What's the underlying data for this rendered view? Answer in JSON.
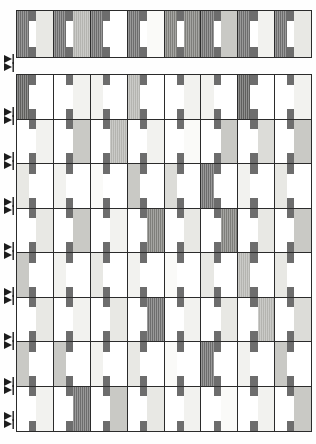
{
  "document": {
    "title": "Weave draft pattern",
    "background_color": "#fefefe",
    "line_color": "#2b2b2b"
  },
  "palette": {
    "white": "#ffffff",
    "paper": "#fafaf8",
    "very_light": "#f2f2ef",
    "light": "#e8e8e4",
    "light_gray": "#dcdcd8",
    "mid_light": "#c9c9c5",
    "mid": "#b4b4b0",
    "mid_dark": "#9a9a96",
    "dark": "#7e7e7a",
    "darker": "#6d6d6d",
    "darkest": "#5f5f5d",
    "knot": "#6d6d6d"
  },
  "layout": {
    "top_strip": {
      "x": 16,
      "y": 10,
      "width": 296,
      "height": 48,
      "columns": 8,
      "rows": 1
    },
    "main_grid": {
      "x": 16,
      "y": 74,
      "width": 296,
      "height": 358,
      "columns": 8,
      "rows": 8
    },
    "cell": {
      "left_pct": 34,
      "stripe_pct": 20,
      "right_pct": 46,
      "knot_height_pct": 22
    }
  },
  "markers": {
    "icon": "double-arrow-marker",
    "x": 3,
    "positions": [
      59,
      67,
      112,
      120,
      157,
      165,
      202,
      210,
      247,
      255,
      292,
      300,
      337,
      345,
      382,
      390,
      416,
      424
    ]
  },
  "chart_data": {
    "type": "heatmap",
    "xlabel": "",
    "ylabel": "",
    "legend": [],
    "grid": true,
    "categories": [
      "c1",
      "c2",
      "c3",
      "c4",
      "c5",
      "c6",
      "c7",
      "c8"
    ],
    "row_labels": [
      "t1",
      "r1",
      "r2",
      "r3",
      "r4",
      "r5",
      "r6",
      "r7",
      "r8"
    ],
    "note": "Each grid cell encodes two gray shades: a left block and a right block, separated by a white warp stripe carrying a dark knot square at top and bottom.",
    "top_strip": {
      "cells": [
        {
          "left": "darker",
          "right": "light"
        },
        {
          "left": "darker",
          "right": "mid"
        },
        {
          "left": "darker",
          "right": "white"
        },
        {
          "left": "darker",
          "right": "paper"
        },
        {
          "left": "dark",
          "right": "dark"
        },
        {
          "left": "darker",
          "right": "mid_light"
        },
        {
          "left": "darker",
          "right": "very_light"
        },
        {
          "left": "darker",
          "right": "light"
        }
      ]
    },
    "rows": [
      {
        "index": 1,
        "cells": [
          {
            "left": "darkest",
            "right": "white"
          },
          {
            "left": "white",
            "right": "very_light"
          },
          {
            "left": "very_light",
            "right": "white"
          },
          {
            "left": "mid",
            "right": "white"
          },
          {
            "left": "white",
            "right": "very_light"
          },
          {
            "left": "very_light",
            "right": "white"
          },
          {
            "left": "darkest",
            "right": "white"
          },
          {
            "left": "white",
            "right": "very_light"
          }
        ]
      },
      {
        "index": 2,
        "cells": [
          {
            "left": "white",
            "right": "very_light"
          },
          {
            "left": "white",
            "right": "mid_light"
          },
          {
            "left": "white",
            "right": "mid"
          },
          {
            "left": "white",
            "right": "very_light"
          },
          {
            "left": "white",
            "right": "paper"
          },
          {
            "left": "white",
            "right": "mid_light"
          },
          {
            "left": "white",
            "right": "light_gray"
          },
          {
            "left": "white",
            "right": "mid_light"
          }
        ]
      },
      {
        "index": 3,
        "cells": [
          {
            "left": "light",
            "right": "white"
          },
          {
            "left": "very_light",
            "right": "white"
          },
          {
            "left": "paper",
            "right": "white"
          },
          {
            "left": "mid_light",
            "right": "white"
          },
          {
            "left": "light_gray",
            "right": "white"
          },
          {
            "left": "darker",
            "right": "white"
          },
          {
            "left": "very_light",
            "right": "white"
          },
          {
            "left": "light",
            "right": "white"
          }
        ]
      },
      {
        "index": 4,
        "cells": [
          {
            "left": "white",
            "right": "light"
          },
          {
            "left": "white",
            "right": "mid_light"
          },
          {
            "left": "white",
            "right": "very_light"
          },
          {
            "left": "white",
            "right": "dark"
          },
          {
            "left": "white",
            "right": "light"
          },
          {
            "left": "white",
            "right": "dark"
          },
          {
            "left": "white",
            "right": "light"
          },
          {
            "left": "white",
            "right": "mid_light"
          }
        ]
      },
      {
        "index": 5,
        "cells": [
          {
            "left": "mid_light",
            "right": "white"
          },
          {
            "left": "very_light",
            "right": "white"
          },
          {
            "left": "light",
            "right": "white"
          },
          {
            "left": "very_light",
            "right": "white"
          },
          {
            "left": "paper",
            "right": "white"
          },
          {
            "left": "light",
            "right": "white"
          },
          {
            "left": "mid",
            "right": "white"
          },
          {
            "left": "light",
            "right": "white"
          }
        ]
      },
      {
        "index": 6,
        "cells": [
          {
            "left": "white",
            "right": "light"
          },
          {
            "left": "white",
            "right": "very_light"
          },
          {
            "left": "white",
            "right": "light"
          },
          {
            "left": "white",
            "right": "darker"
          },
          {
            "left": "white",
            "right": "very_light"
          },
          {
            "left": "white",
            "right": "light"
          },
          {
            "left": "white",
            "right": "mid"
          },
          {
            "left": "white",
            "right": "light_gray"
          }
        ]
      },
      {
        "index": 7,
        "cells": [
          {
            "left": "mid_light",
            "right": "white"
          },
          {
            "left": "mid_light",
            "right": "white"
          },
          {
            "left": "very_light",
            "right": "white"
          },
          {
            "left": "light",
            "right": "white"
          },
          {
            "left": "paper",
            "right": "white"
          },
          {
            "left": "darker",
            "right": "white"
          },
          {
            "left": "very_light",
            "right": "white"
          },
          {
            "left": "mid_light",
            "right": "white"
          }
        ]
      },
      {
        "index": 8,
        "cells": [
          {
            "left": "white",
            "right": "very_light"
          },
          {
            "left": "white",
            "right": "darker"
          },
          {
            "left": "white",
            "right": "mid_light"
          },
          {
            "left": "white",
            "right": "light"
          },
          {
            "left": "white",
            "right": "very_light"
          },
          {
            "left": "white",
            "right": "paper"
          },
          {
            "left": "white",
            "right": "very_light"
          },
          {
            "left": "white",
            "right": "mid_light"
          }
        ]
      }
    ]
  }
}
